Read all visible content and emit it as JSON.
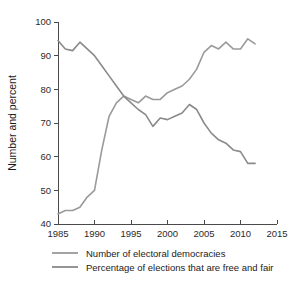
{
  "chart_data": {
    "type": "line",
    "title": "",
    "xlabel": "",
    "ylabel": "Number and percent",
    "xlim": [
      1985,
      2015
    ],
    "ylim": [
      40,
      100
    ],
    "xticks": [
      1985,
      1990,
      1995,
      2000,
      2005,
      2010,
      2015
    ],
    "yticks": [
      40,
      50,
      60,
      70,
      80,
      90,
      100
    ],
    "grid": false,
    "legend_position": "bottom",
    "colors": {
      "democracies": "#9a9a9a",
      "free_and_fair": "#8a8a8a",
      "axis": "#4a4a4a",
      "text": "#1a1a1a"
    },
    "series": [
      {
        "name": "Number of electoral democracies",
        "color": "#9a9a9a",
        "x": [
          1985,
          1986,
          1987,
          1988,
          1989,
          1990,
          1991,
          1992,
          1993,
          1994,
          1995,
          1996,
          1997,
          1998,
          1999,
          2000,
          2001,
          2002,
          2003,
          2004,
          2005,
          2006,
          2007,
          2008,
          2009,
          2010,
          2011,
          2012
        ],
        "values": [
          43,
          44,
          44,
          45,
          48,
          50,
          62,
          72,
          76,
          78,
          77,
          76,
          78,
          77,
          77,
          79,
          80,
          81,
          83,
          86,
          91,
          93,
          92,
          94,
          92,
          92,
          95,
          93.5
        ]
      },
      {
        "name": "Percentage of elections that are free and fair",
        "color": "#8a8a8a",
        "x": [
          1985,
          1986,
          1987,
          1988,
          1989,
          1990,
          1991,
          1992,
          1993,
          1994,
          1995,
          1996,
          1997,
          1998,
          1999,
          2000,
          2001,
          2002,
          2003,
          2004,
          2005,
          2006,
          2007,
          2008,
          2009,
          2010,
          2011,
          2012
        ],
        "values": [
          94.5,
          92,
          91.5,
          94,
          92,
          90,
          87,
          84,
          81,
          78,
          76,
          74,
          72.5,
          69,
          71.5,
          71,
          72,
          73,
          75.5,
          74,
          70,
          67,
          65,
          64,
          62,
          61.5,
          58,
          58
        ]
      }
    ],
    "legend": [
      {
        "label": "Number of electoral democracies",
        "color": "#9a9a9a"
      },
      {
        "label": "Percentage of elections that are free and fair",
        "color": "#8a8a8a"
      }
    ]
  }
}
